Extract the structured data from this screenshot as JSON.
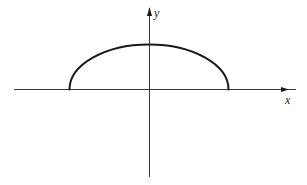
{
  "diagram": {
    "type": "coordinate-axes-with-curve",
    "axes": {
      "x_label": "x",
      "y_label": "y"
    },
    "curve": {
      "shape": "upper-half-ellipse",
      "description": "Upper half of an ellipse centered at the origin, intersecting the x-axis symmetrically on both sides of the y-axis"
    },
    "colors": {
      "background": "#ffffff",
      "axis": "#3a3a3a",
      "curve": "#1a1a1a",
      "label": "#222222"
    }
  }
}
